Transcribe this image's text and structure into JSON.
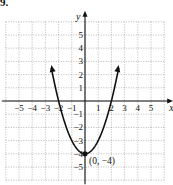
{
  "problem_label": "9.",
  "chart_data": {
    "type": "line",
    "title": "",
    "function": "y = x^2 - 4",
    "xlabel": "x",
    "ylabel": "y",
    "xlim": [
      -6,
      6
    ],
    "ylim": [
      -6,
      6
    ],
    "grid": true,
    "x_ticks": [
      -5,
      -4,
      -3,
      -2,
      -1,
      1,
      2,
      3,
      4,
      5
    ],
    "y_ticks": [
      -5,
      -4,
      -3,
      -2,
      -1,
      1,
      2,
      3,
      4,
      5
    ],
    "series": [
      {
        "name": "parabola",
        "x": [
          -2.5,
          -2,
          -1.5,
          -1,
          -0.5,
          0,
          0.5,
          1,
          1.5,
          2,
          2.5
        ],
        "y": [
          2.25,
          0,
          -1.75,
          -3,
          -3.75,
          -4,
          -3.75,
          -3,
          -1.75,
          0,
          2.25
        ]
      }
    ],
    "annotations": [
      {
        "text": "(0, −4)",
        "x": 0,
        "y": -4,
        "type": "point"
      }
    ]
  }
}
